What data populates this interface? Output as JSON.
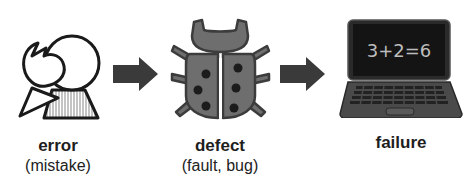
{
  "diagram": {
    "stages": [
      {
        "label": "error",
        "sublabel": "(mistake)",
        "icon": "error-person-icon"
      },
      {
        "label": "defect",
        "sublabel": "(fault, bug)",
        "icon": "bug-icon"
      },
      {
        "label": "failure",
        "sublabel": "",
        "icon": "laptop-icon"
      }
    ],
    "arrows": [
      {
        "from": "error",
        "to": "defect",
        "icon": "arrow-right-icon"
      },
      {
        "from": "defect",
        "to": "failure",
        "icon": "arrow-right-icon"
      }
    ],
    "laptop_screen_text": "3+2=6",
    "colors": {
      "arrow": "#3a3a3a",
      "bug_body": "#6e6e6e",
      "bug_outline": "#3c3c3c",
      "bug_spots": "#1c1c1c",
      "laptop_body": "#4a4a4a",
      "laptop_screen": "#1a1a1a",
      "screen_text": "#bdbdbd"
    }
  }
}
